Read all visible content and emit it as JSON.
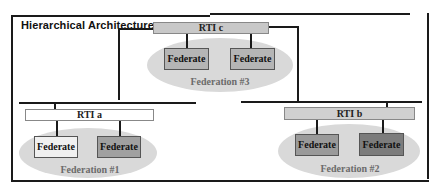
{
  "diagram": {
    "title": "Hierarchical Architecture",
    "colors": {
      "rti_c_fill": "#c8c8c8",
      "rti_a_fill": "#ffffff",
      "rti_b_fill": "#d0d0d0",
      "ellipse_fill": "#d9d9d9",
      "federate_light": "#f0f0f0",
      "federate_mid": "#b5b5b5",
      "federate_dark": "#8a8a8a",
      "federation_label": "#6b6b6b"
    },
    "rtis": [
      {
        "id": "c",
        "label": "RTI c"
      },
      {
        "id": "a",
        "label": "RTI a"
      },
      {
        "id": "b",
        "label": "RTI b"
      }
    ],
    "federations": [
      {
        "label": "Federation #3",
        "federates": [
          "Federate",
          "Federate"
        ]
      },
      {
        "label": "Federation #1",
        "federates": [
          "Federate",
          "Federate"
        ]
      },
      {
        "label": "Federation #2",
        "federates": [
          "Federate",
          "Federate"
        ]
      }
    ]
  }
}
